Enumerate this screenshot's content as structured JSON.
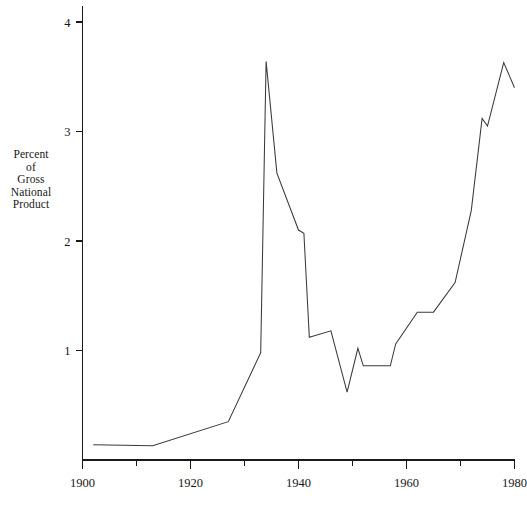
{
  "chart_data": {
    "type": "line",
    "title": "",
    "subtitle": "",
    "xlabel": "",
    "ylabel": "Percent of Gross National Product",
    "ylabel_lines": [
      "Percent",
      "of",
      "Gross",
      "National",
      "Product"
    ],
    "xlim": [
      1900,
      1980
    ],
    "ylim": [
      0,
      4.15
    ],
    "grid": false,
    "legend": null,
    "line_color": "#3a3a3a",
    "axis_color": "#1a1a1a",
    "y_ticks": [
      1,
      2,
      3,
      4
    ],
    "y_tick_labels": [
      "1",
      "2",
      "3",
      "4"
    ],
    "x_ticks_major": [
      1900,
      1920,
      1940,
      1960,
      1980
    ],
    "x_tick_labels": [
      "1900",
      "1920",
      "1940",
      "1960",
      "1980"
    ],
    "x_ticks_minor": [
      1910,
      1930,
      1950,
      1970
    ],
    "series": [
      {
        "name": "Federal spending as percent of GNP",
        "x": [
          1902,
          1913,
          1927,
          1933,
          1934,
          1936,
          1940,
          1941,
          1942,
          1946,
          1949,
          1951,
          1952,
          1957,
          1958,
          1962,
          1965,
          1969,
          1972,
          1974,
          1975,
          1978,
          1980
        ],
        "y": [
          0.14,
          0.13,
          0.35,
          0.98,
          3.64,
          2.62,
          2.1,
          2.07,
          1.12,
          1.18,
          0.62,
          1.02,
          0.86,
          0.86,
          1.06,
          1.35,
          1.35,
          1.62,
          2.28,
          3.12,
          3.05,
          3.63,
          3.4
        ]
      }
    ]
  }
}
